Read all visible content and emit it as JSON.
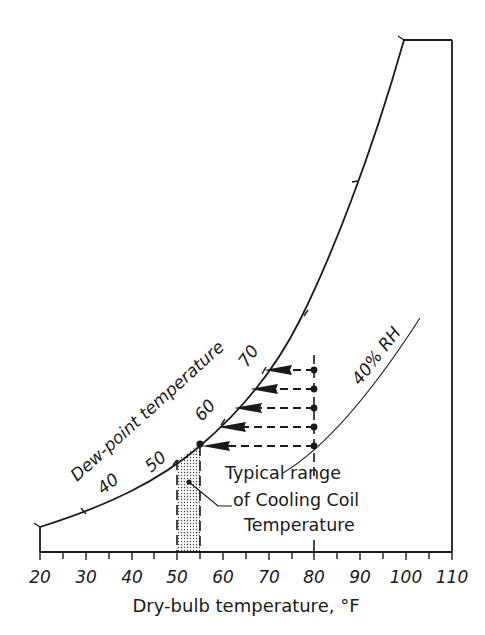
{
  "diagram": {
    "type": "psychrometric-sketch",
    "x_axis": {
      "title": "Dry-bulb temperature, °F",
      "ticks": [
        "20",
        "30",
        "40",
        "50",
        "60",
        "70",
        "80",
        "90",
        "100",
        "110"
      ],
      "range": [
        20,
        110
      ]
    },
    "saturation_curve": {
      "label": "Dew-point temperature",
      "tick_labels": [
        "40",
        "50",
        "60",
        "70"
      ]
    },
    "rh_curve": {
      "label": "40% RH"
    },
    "annotation": {
      "line1": "Typical range",
      "line2": "of Cooling Coil",
      "line3": "Temperature"
    },
    "shaded_range": {
      "from": 50,
      "to": 55
    },
    "arrows": {
      "start_dry_bulb": 80,
      "count": 5
    },
    "colors": {
      "ink": "#1a1a1a",
      "background": "#ffffff",
      "shade": "#cfcfcf"
    }
  }
}
